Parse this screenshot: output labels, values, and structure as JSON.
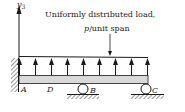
{
  "diagram": {
    "title": "Uniformly distributed load,",
    "subtitle_italic": "p",
    "subtitle_rest": "/unit span",
    "axis_label": "y",
    "axis_subscript": "3",
    "points": {
      "A": "A",
      "D": "D",
      "B": "B",
      "C": "C"
    },
    "colors": {
      "beam_fill": "#d9d9d9",
      "line": "#1a1a1a",
      "hatch": "#555555"
    }
  }
}
